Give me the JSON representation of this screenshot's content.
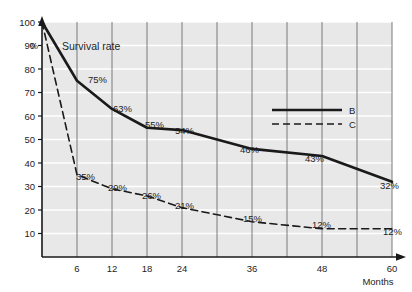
{
  "chart_data": {
    "type": "line",
    "title": "Survival rate",
    "xlabel": "Months",
    "ylabel": "%",
    "x": [
      0,
      6,
      12,
      18,
      24,
      36,
      48,
      60
    ],
    "xlim": [
      0,
      60
    ],
    "ylim": [
      0,
      100
    ],
    "grid": true,
    "legend_position": "center-right",
    "x_ticks_labeled": [
      "6",
      "12",
      "18",
      "24",
      "36",
      "48",
      "60"
    ],
    "x_tick_values_labeled": [
      6,
      12,
      18,
      24,
      36,
      48,
      60
    ],
    "x_gridline_values": [
      6,
      12,
      18,
      24,
      30,
      36,
      42,
      48,
      54,
      60
    ],
    "y_ticks": [
      "100",
      "90",
      "80",
      "70",
      "60",
      "50",
      "40",
      "30",
      "20",
      "10"
    ],
    "y_tick_values": [
      100,
      90,
      80,
      70,
      60,
      50,
      40,
      30,
      20,
      10
    ],
    "series": [
      {
        "name": "B",
        "style": "solid",
        "color": "#1a1a1a",
        "values": [
          100,
          75,
          63,
          55,
          54,
          46,
          43,
          32
        ],
        "point_labels": [
          "",
          "75%",
          "63%",
          "55%",
          "54%",
          "46%",
          "43%",
          "32%"
        ]
      },
      {
        "name": "C",
        "style": "dashed",
        "color": "#1a1a1a",
        "values": [
          100,
          35,
          29,
          26,
          21,
          15,
          12,
          12
        ],
        "point_labels": [
          "",
          "35%",
          "29%",
          "26%",
          "21%",
          "15%",
          "12%",
          "12%"
        ]
      }
    ],
    "annotations": [
      {
        "text": "75%",
        "x": 88,
        "y": 83
      },
      {
        "text": "63%",
        "x": 113,
        "y": 112
      },
      {
        "text": "55%",
        "x": 145,
        "y": 128
      },
      {
        "text": "54%",
        "x": 175,
        "y": 134
      },
      {
        "text": "46%",
        "x": 240,
        "y": 153
      },
      {
        "text": "43%",
        "x": 305,
        "y": 162
      },
      {
        "text": "32%",
        "x": 380,
        "y": 189
      },
      {
        "text": "35%",
        "x": 76,
        "y": 180
      },
      {
        "text": "29%",
        "x": 108,
        "y": 191
      },
      {
        "text": "26%",
        "x": 142,
        "y": 199
      },
      {
        "text": "21%",
        "x": 175,
        "y": 209
      },
      {
        "text": "15%",
        "x": 243,
        "y": 222
      },
      {
        "text": "12%",
        "x": 312,
        "y": 228
      },
      {
        "text": "12%",
        "x": 383,
        "y": 235
      }
    ],
    "colors": {
      "plot_background": "#e8e8e8",
      "gridline_horizontal": "#ffffff",
      "gridline_vertical": "#6e6e6e",
      "axis": "#1a1a1a",
      "line": "#1a1a1a",
      "page_background": "#ffffff"
    }
  },
  "legend": {
    "entries": [
      {
        "label": "B",
        "style": "solid"
      },
      {
        "label": "C",
        "style": "dashed"
      }
    ]
  },
  "axes": {
    "y_unit": "%",
    "x_caption": "Months"
  }
}
